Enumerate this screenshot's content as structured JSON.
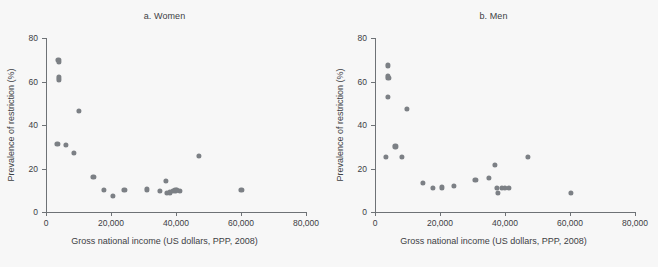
{
  "figure": {
    "background_color": "#f7f7f7",
    "dot_color": "#7c8085",
    "axis_color": "#6e7276",
    "text_color": "#3d4044"
  },
  "panels": [
    {
      "key": "women",
      "title": "a. Women",
      "xlabel": "Gross national income (US dollars, PPP, 2008)",
      "ylabel": "Prevalence of restriction (%)"
    },
    {
      "key": "men",
      "title": "b. Men",
      "xlabel": "Gross national income (US dollars, PPP, 2008)",
      "ylabel": "Prevalence of restriction (%)"
    }
  ],
  "axes": {
    "x_ticks": [
      0,
      20000,
      40000,
      60000,
      80000
    ],
    "x_tick_labels": [
      "0",
      "20,000",
      "40,000",
      "60,000",
      "80,000"
    ],
    "y_ticks": [
      0,
      20,
      40,
      60,
      80
    ],
    "y_tick_labels": [
      "0",
      "20",
      "40",
      "60",
      "80"
    ],
    "xlim": [
      0,
      80000
    ],
    "ylim": [
      0,
      80
    ]
  },
  "chart_data": [
    {
      "type": "scatter",
      "title": "a. Women",
      "xlabel": "Gross national income (US dollars, PPP, 2008)",
      "ylabel": "Prevalence of restriction (%)",
      "xlim": [
        0,
        80000
      ],
      "ylim": [
        0,
        80
      ],
      "grid": false,
      "legend": "none",
      "marker_color": "#7c8085",
      "points": [
        {
          "x": 3800,
          "y": 70.0
        },
        {
          "x": 3900,
          "y": 69.0
        },
        {
          "x": 4000,
          "y": 62.0
        },
        {
          "x": 4000,
          "y": 61.0
        },
        {
          "x": 3500,
          "y": 31.2
        },
        {
          "x": 6200,
          "y": 30.8
        },
        {
          "x": 8600,
          "y": 27.2
        },
        {
          "x": 10200,
          "y": 46.3
        },
        {
          "x": 14600,
          "y": 16.0
        },
        {
          "x": 17800,
          "y": 10.2
        },
        {
          "x": 20600,
          "y": 7.5
        },
        {
          "x": 24100,
          "y": 10.1
        },
        {
          "x": 31000,
          "y": 10.4
        },
        {
          "x": 35100,
          "y": 9.8
        },
        {
          "x": 36900,
          "y": 14.2
        },
        {
          "x": 37100,
          "y": 8.7
        },
        {
          "x": 38200,
          "y": 9.0
        },
        {
          "x": 39100,
          "y": 9.6
        },
        {
          "x": 39800,
          "y": 9.9
        },
        {
          "x": 40400,
          "y": 10.0
        },
        {
          "x": 41300,
          "y": 9.8
        },
        {
          "x": 47000,
          "y": 25.9
        },
        {
          "x": 60100,
          "y": 10.1
        }
      ]
    },
    {
      "type": "scatter",
      "title": "b. Men",
      "xlabel": "Gross national income (US dollars, PPP, 2008)",
      "ylabel": "Prevalence of restriction (%)",
      "xlim": [
        0,
        80000
      ],
      "ylim": [
        0,
        80
      ],
      "grid": false,
      "legend": "none",
      "marker_color": "#7c8085",
      "points": [
        {
          "x": 3900,
          "y": 67.4
        },
        {
          "x": 3900,
          "y": 62.6
        },
        {
          "x": 4100,
          "y": 61.7
        },
        {
          "x": 4000,
          "y": 53.0
        },
        {
          "x": 3300,
          "y": 25.2
        },
        {
          "x": 6300,
          "y": 30.2
        },
        {
          "x": 8400,
          "y": 25.2
        },
        {
          "x": 9900,
          "y": 47.3
        },
        {
          "x": 14800,
          "y": 13.3
        },
        {
          "x": 17900,
          "y": 10.9
        },
        {
          "x": 20500,
          "y": 11.3
        },
        {
          "x": 24200,
          "y": 12.0
        },
        {
          "x": 30900,
          "y": 14.7
        },
        {
          "x": 35000,
          "y": 15.8
        },
        {
          "x": 36900,
          "y": 21.8
        },
        {
          "x": 37400,
          "y": 10.9
        },
        {
          "x": 37800,
          "y": 8.8
        },
        {
          "x": 39000,
          "y": 11.2
        },
        {
          "x": 40000,
          "y": 11.0
        },
        {
          "x": 41200,
          "y": 11.1
        },
        {
          "x": 47100,
          "y": 25.5
        },
        {
          "x": 60300,
          "y": 8.9
        }
      ]
    }
  ]
}
